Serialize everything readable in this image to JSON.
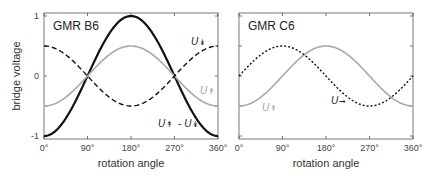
{
  "chart_data": [
    {
      "type": "line",
      "title": "GMR B6",
      "xlabel": "rotation angle",
      "ylabel": "bridge voltage",
      "xlim": [
        0,
        360
      ],
      "ylim": [
        -1,
        1
      ],
      "xticks": [
        0,
        90,
        180,
        270,
        360
      ],
      "xtick_labels": [
        "0°",
        "90°",
        "180°",
        "270°",
        "360°"
      ],
      "yticks": [
        -1,
        0,
        1
      ],
      "ytick_labels": [
        "-1",
        "0",
        "1"
      ],
      "series": [
        {
          "name": "U↓ - U↓ (difference)",
          "label": "U↟ - U↡",
          "style": "solid-black",
          "color": "#111111",
          "formula": "-cos(x)",
          "amplitude": 1,
          "values_at_ticks": [
            -1,
            0,
            1,
            0,
            -1
          ]
        },
        {
          "name": "U↑ (grey)",
          "label": "U↟",
          "style": "solid-grey",
          "color": "#a8a8a8",
          "formula": "-0.5*cos(x)",
          "amplitude": 0.5,
          "values_at_ticks": [
            -0.5,
            0,
            0.5,
            0,
            -0.5
          ]
        },
        {
          "name": "U↓ (dashed)",
          "label": "U↡",
          "style": "dashed-black",
          "color": "#111111",
          "formula": "0.5*cos(x)",
          "amplitude": 0.5,
          "values_at_ticks": [
            0.5,
            0,
            -0.5,
            0,
            0.5
          ]
        }
      ]
    },
    {
      "type": "line",
      "title": "GMR C6",
      "xlabel": "rotation angle",
      "ylabel": "",
      "xlim": [
        0,
        360
      ],
      "ylim": [
        -1,
        1
      ],
      "xticks": [
        0,
        90,
        180,
        270,
        360
      ],
      "xtick_labels": [
        "0°",
        "90°",
        "180°",
        "270°",
        "360°"
      ],
      "series": [
        {
          "name": "U↑ (grey)",
          "label": "U↟",
          "style": "solid-grey",
          "color": "#a8a8a8",
          "formula": "-0.5*cos(x)",
          "amplitude": 0.5,
          "values_at_ticks": [
            -0.5,
            0,
            0.5,
            0,
            -0.5
          ]
        },
        {
          "name": "U→ (dotted)",
          "label": "U→",
          "style": "dotted-black",
          "color": "#111111",
          "formula": "0.5*sin(x)",
          "amplitude": 0.5,
          "values_at_ticks": [
            0,
            0.5,
            0,
            -0.5,
            0
          ]
        }
      ]
    }
  ]
}
